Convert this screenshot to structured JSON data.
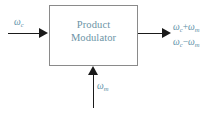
{
  "diagram": {
    "block": {
      "label_line1": "Product",
      "label_line2": "Modulator"
    },
    "input": {
      "symbol": "ω",
      "subscript": "c"
    },
    "modulating": {
      "symbol": "ω",
      "subscript": "m"
    },
    "outputs": [
      {
        "symbol1": "ω",
        "sub1": "c",
        "operator": "+",
        "symbol2": "ω",
        "sub2": "m"
      },
      {
        "symbol1": "ω",
        "sub1": "c",
        "operator": "−",
        "symbol2": "ω",
        "sub2": "m"
      }
    ],
    "colors": {
      "label_blue": "#5d8fa6",
      "block_text": "#6c93a6",
      "block_border": "#8a8a8a",
      "line": "#1a1a1a",
      "background": "#ffffff"
    }
  }
}
